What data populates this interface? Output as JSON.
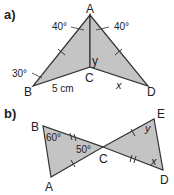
{
  "colors": {
    "fill": "#c4c4c4",
    "stroke": "#333333",
    "text": "#222222"
  },
  "diagram_a": {
    "label": "a)",
    "vertices": {
      "A": "A",
      "B": "B",
      "C": "C",
      "D": "D"
    },
    "angles": {
      "at_A_left": "40°",
      "at_A_right": "40°",
      "at_B": "30°"
    },
    "side_BC": "5 cm",
    "unknowns": {
      "y": "y",
      "x": "x"
    }
  },
  "diagram_b": {
    "label": "b)",
    "vertices": {
      "A": "A",
      "B": "B",
      "C": "C",
      "D": "D",
      "E": "E"
    },
    "angles": {
      "at_B": "60°",
      "at_C": "50°"
    },
    "unknowns": {
      "y": "y",
      "x": "x"
    }
  }
}
